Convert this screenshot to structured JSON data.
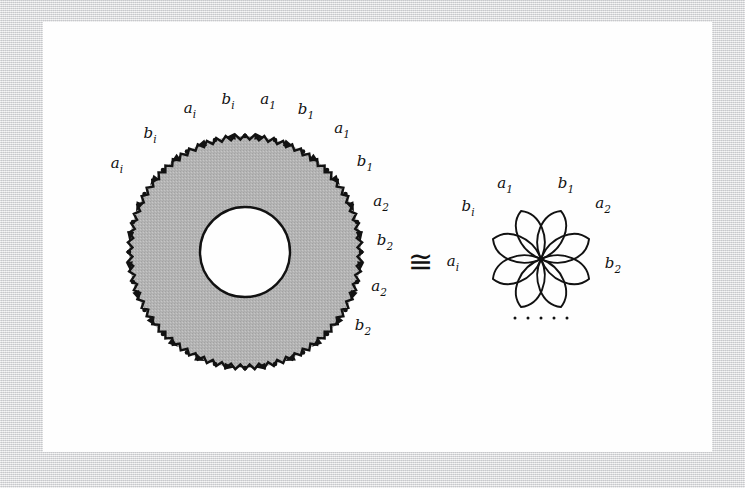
{
  "figure": {
    "kind": "mathematical-illustration",
    "caption_text": "",
    "equivalence_symbol": "≅",
    "ellipsis": "· · · · ·",
    "colors": {
      "page_background": "#d9dadc",
      "sheet": "#fefefe",
      "ink": "#121212",
      "annulus_fill": "#b4b4b4"
    }
  },
  "annulus": {
    "name": "shaded annulus with scalloped outer boundary",
    "center": {
      "x": 245,
      "y": 252
    },
    "outer_radius": 116,
    "inner_radius": 45,
    "fill": "#b4b4b4",
    "boundary_labels": [
      {
        "id": "ann-lbl-1",
        "base": "a",
        "sub": "i",
        "x": 117,
        "y": 168
      },
      {
        "id": "ann-lbl-2",
        "base": "b",
        "sub": "i",
        "x": 150,
        "y": 138
      },
      {
        "id": "ann-lbl-3",
        "base": "a",
        "sub": "i",
        "x": 190,
        "y": 113
      },
      {
        "id": "ann-lbl-4",
        "base": "b",
        "sub": "i",
        "x": 228,
        "y": 104
      },
      {
        "id": "ann-lbl-5",
        "base": "a",
        "sub": "1",
        "x": 268,
        "y": 104
      },
      {
        "id": "ann-lbl-6",
        "base": "b",
        "sub": "1",
        "x": 306,
        "y": 114
      },
      {
        "id": "ann-lbl-7",
        "base": "a",
        "sub": "1",
        "x": 342,
        "y": 133
      },
      {
        "id": "ann-lbl-8",
        "base": "b",
        "sub": "1",
        "x": 365,
        "y": 166
      },
      {
        "id": "ann-lbl-9",
        "base": "a",
        "sub": "2",
        "x": 381,
        "y": 206
      },
      {
        "id": "ann-lbl-10",
        "base": "b",
        "sub": "2",
        "x": 385,
        "y": 245
      },
      {
        "id": "ann-lbl-11",
        "base": "a",
        "sub": "2",
        "x": 379,
        "y": 291
      },
      {
        "id": "ann-lbl-12",
        "base": "b",
        "sub": "2",
        "x": 363,
        "y": 330
      }
    ]
  },
  "equivalence": {
    "symbol": "≅",
    "x": 408,
    "y": 262
  },
  "rose": {
    "name": "wedge of circles (bouquet / rose) with 8 petals",
    "center": {
      "x": 541,
      "y": 259
    },
    "petal_count": 8,
    "petal_length": 52,
    "petal_width": 17,
    "ellipsis": "· · · · ·",
    "ellipsis_position": {
      "x": 541,
      "y": 318
    },
    "labels": [
      {
        "id": "rose-lbl-a1",
        "base": "a",
        "sub": "1",
        "x": 505,
        "y": 188
      },
      {
        "id": "rose-lbl-b1",
        "base": "b",
        "sub": "1",
        "x": 566,
        "y": 188
      },
      {
        "id": "rose-lbl-bi",
        "base": "b",
        "sub": "i",
        "x": 468,
        "y": 211
      },
      {
        "id": "rose-lbl-a2",
        "base": "a",
        "sub": "2",
        "x": 603,
        "y": 208
      },
      {
        "id": "rose-lbl-ai",
        "base": "a",
        "sub": "i",
        "x": 453,
        "y": 266
      },
      {
        "id": "rose-lbl-b2",
        "base": "b",
        "sub": "2",
        "x": 613,
        "y": 268
      }
    ]
  }
}
